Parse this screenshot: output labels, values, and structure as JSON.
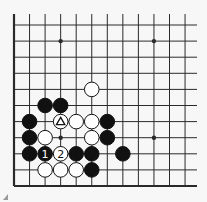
{
  "diagram": {
    "type": "go-board-fragment",
    "colors": {
      "background": "#f7f7f7",
      "line": "#2a2a2a",
      "black": "#111111",
      "white": "#ffffff"
    },
    "grid": {
      "cols": 12,
      "rows": 11,
      "x0": 14,
      "dx": 15.55,
      "y0": 25,
      "dy": 16.1,
      "top_extend": 14,
      "right_extend": 197,
      "left_edge": true,
      "bottom_edge": true
    },
    "star_points": [
      [
        3,
        1
      ],
      [
        9,
        1
      ],
      [
        3,
        7
      ],
      [
        9,
        7
      ]
    ],
    "stones": [
      {
        "col": 5,
        "row": 4,
        "color": "white"
      },
      {
        "col": 2,
        "row": 5,
        "color": "black"
      },
      {
        "col": 3,
        "row": 5,
        "color": "black"
      },
      {
        "col": 1,
        "row": 6,
        "color": "black"
      },
      {
        "col": 3,
        "row": 6,
        "color": "white",
        "mark": "triangle"
      },
      {
        "col": 4,
        "row": 6,
        "color": "white"
      },
      {
        "col": 5,
        "row": 6,
        "color": "white"
      },
      {
        "col": 6,
        "row": 6,
        "color": "black"
      },
      {
        "col": 1,
        "row": 7,
        "color": "black"
      },
      {
        "col": 2,
        "row": 7,
        "color": "white"
      },
      {
        "col": 5,
        "row": 7,
        "color": "white"
      },
      {
        "col": 6,
        "row": 7,
        "color": "black"
      },
      {
        "col": 1,
        "row": 8,
        "color": "black"
      },
      {
        "col": 2,
        "row": 8,
        "color": "black",
        "label": "1"
      },
      {
        "col": 3,
        "row": 8,
        "color": "white",
        "label": "2"
      },
      {
        "col": 4,
        "row": 8,
        "color": "black"
      },
      {
        "col": 5,
        "row": 8,
        "color": "black"
      },
      {
        "col": 7,
        "row": 8,
        "color": "black"
      },
      {
        "col": 2,
        "row": 9,
        "color": "white"
      },
      {
        "col": 3,
        "row": 9,
        "color": "white"
      },
      {
        "col": 4,
        "row": 9,
        "color": "white"
      },
      {
        "col": 5,
        "row": 9,
        "color": "black"
      }
    ]
  }
}
